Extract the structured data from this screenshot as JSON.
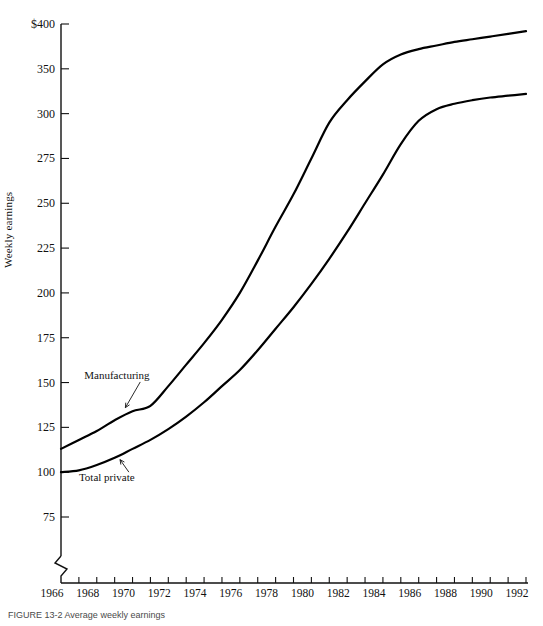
{
  "figure": {
    "caption": "FIGURE 13-2  Average weekly earnings",
    "ylabel": "Weekly earnings"
  },
  "chart_data": {
    "type": "line",
    "title": "",
    "xlabel": "",
    "ylabel": "Weekly earnings",
    "grid": false,
    "legend": "inline-annotations",
    "axis_break": true,
    "ylim": [
      75,
      400
    ],
    "xlim": [
      1966,
      1992
    ],
    "ytick_labels": [
      "$400",
      "350",
      "300",
      "275",
      "250",
      "225",
      "200",
      "175",
      "150",
      "125",
      "100",
      "75"
    ],
    "ytick_values": [
      400,
      350,
      300,
      275,
      250,
      225,
      200,
      175,
      150,
      125,
      100,
      75
    ],
    "xtick_labels": [
      "1966",
      "1968",
      "1970",
      "1972",
      "1974",
      "1976",
      "1978",
      "1980",
      "1982",
      "1984",
      "1986",
      "1988",
      "1990",
      "1992"
    ],
    "xtick_values": [
      1966,
      1968,
      1970,
      1972,
      1974,
      1976,
      1978,
      1980,
      1982,
      1984,
      1986,
      1988,
      1990,
      1992
    ],
    "x": [
      1966,
      1967,
      1968,
      1969,
      1970,
      1971,
      1972,
      1973,
      1974,
      1975,
      1976,
      1977,
      1978,
      1979,
      1980,
      1981,
      1982,
      1983,
      1984,
      1985,
      1986,
      1987,
      1988,
      1989,
      1990,
      1991,
      1992
    ],
    "series": [
      {
        "name": "Manufacturing",
        "label_text": "Manufacturing",
        "values": [
          113,
          118,
          123,
          129,
          134,
          137,
          148,
          160,
          172,
          185,
          200,
          218,
          237,
          255,
          275,
          295,
          315,
          336,
          355,
          366,
          372,
          376,
          380,
          383,
          386,
          389,
          392
        ]
      },
      {
        "name": "Total private",
        "label_text": "Total private",
        "values": [
          100,
          101,
          104,
          108,
          113,
          118,
          124,
          131,
          139,
          148,
          157,
          168,
          180,
          192,
          205,
          219,
          234,
          250,
          266,
          283,
          296,
          305,
          311,
          315,
          318,
          320,
          322
        ]
      }
    ],
    "annotations": [
      {
        "text": "Manufacturing",
        "x": 1969.5,
        "y": 152
      },
      {
        "text": "Total private",
        "x": 1969.0,
        "y": 96
      }
    ]
  }
}
